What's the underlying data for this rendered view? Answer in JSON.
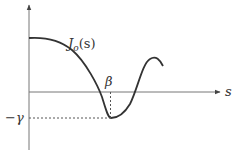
{
  "diagram": {
    "type": "function-plot",
    "curve_label_main": "J",
    "curve_label_sub": "o",
    "curve_label_arg": "(s)",
    "x_axis_label": "s",
    "x_marker_label": "β",
    "y_marker_label": "−γ",
    "colors": {
      "axis": "#777777",
      "curve": "#333333",
      "dashed": "#555555",
      "text": "#333333"
    }
  }
}
